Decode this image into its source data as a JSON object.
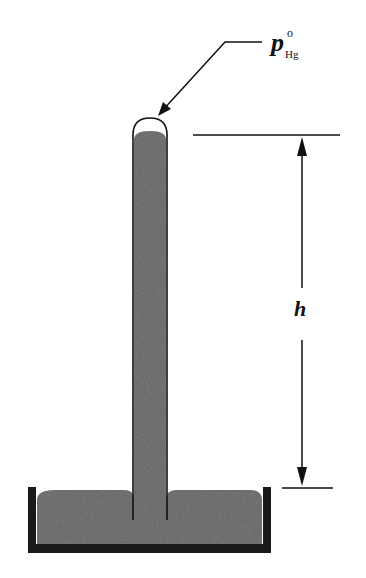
{
  "diagram": {
    "labels": {
      "pressure_symbol": "p",
      "pressure_superscript": "o",
      "pressure_subscript": "Hg",
      "height_symbol": "h"
    },
    "colors": {
      "mercury": "#5a5a5a",
      "dish": "#1a1a1a",
      "line": "#111111",
      "background": "#ffffff"
    }
  }
}
